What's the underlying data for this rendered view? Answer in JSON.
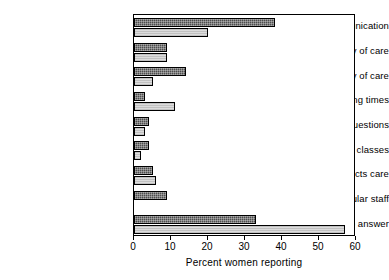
{
  "chart_data": {
    "type": "bar",
    "orientation": "horizontal",
    "title": "",
    "xlabel": "Percent women reporting",
    "ylabel": "",
    "xlim": [
      0,
      60
    ],
    "xticks": [
      0,
      10,
      20,
      30,
      40,
      50,
      60
    ],
    "xtick_labels": [
      "0",
      "10",
      "20",
      "30",
      "40",
      "50",
      "60"
    ],
    "grid": false,
    "legend_position": "right-middle",
    "categories": [
      "Communication",
      "Continuity of care",
      "Efficiency of care",
      "Waiting times",
      "Answers to questions",
      "Antenatal classes",
      "Other aspects care",
      "Particular staff",
      "No answer"
    ],
    "series": [
      {
        "name": "Satisfied",
        "color": "#4d4d4d",
        "values": [
          38,
          9,
          14,
          3,
          4,
          4,
          5,
          9,
          33
        ]
      },
      {
        "name": "Dissatisfied",
        "color": "#dcdcdc",
        "values": [
          20,
          9,
          5,
          11,
          3,
          2,
          6,
          0,
          57
        ]
      }
    ]
  },
  "legend": {
    "items": [
      {
        "label": "Satisfied",
        "key": "satisfied"
      },
      {
        "label": "Dissatisfied",
        "key": "dissatisfied"
      }
    ]
  },
  "colors": {
    "satisfied": "#4d4d4d",
    "dissatisfied": "#dcdcdc",
    "axis": "#000000",
    "background": "#ffffff"
  }
}
